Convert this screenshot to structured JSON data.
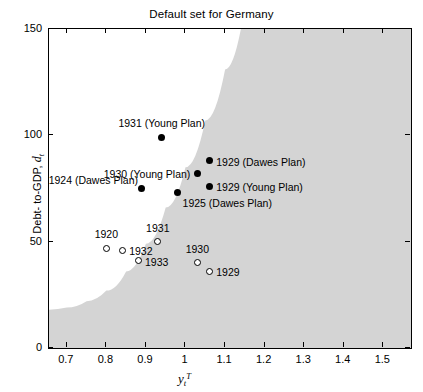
{
  "chart_data": {
    "type": "scatter",
    "title": "Default set for Germany",
    "xlabel": "y_t^T",
    "ylabel": "Debt- to-GDP, d_t",
    "xlim": [
      0.655,
      1.57
    ],
    "ylim": [
      0,
      150
    ],
    "xticks": [
      0.7,
      0.8,
      0.9,
      1.0,
      1.1,
      1.2,
      1.3,
      1.4,
      1.5
    ],
    "xticklabels": [
      "0.7",
      "0.8",
      "0.9",
      "1",
      "1.1",
      "1.2",
      "1.3",
      "1.4",
      "1.5"
    ],
    "yticks": [
      0,
      50,
      100,
      150
    ],
    "yticklabels": [
      "0",
      "50",
      "100",
      "150"
    ],
    "grid": false,
    "legend": "none",
    "shaded_region": {
      "name": "default-set",
      "color": "#d4d4d4",
      "description": "Shaded default region to the lower-right of the boundary curve",
      "boundary_points": [
        [
          0.655,
          18
        ],
        [
          0.7,
          19
        ],
        [
          0.75,
          22
        ],
        [
          0.8,
          27
        ],
        [
          0.85,
          36
        ],
        [
          0.9,
          49
        ],
        [
          0.95,
          66
        ],
        [
          1.0,
          85
        ],
        [
          1.05,
          107
        ],
        [
          1.1,
          131
        ],
        [
          1.14,
          150
        ]
      ]
    },
    "series": [
      {
        "name": "Dawes/Young Plan obligations",
        "marker": "filled-circle",
        "color": "#000000",
        "points": [
          {
            "label": "1931 (Young Plan)",
            "x": 0.94,
            "y": 99,
            "label_pos": "above"
          },
          {
            "label": "1929 (Dawes Plan)",
            "x": 1.06,
            "y": 88,
            "label_pos": "right"
          },
          {
            "label": "1930 (Young Plan)",
            "x": 1.03,
            "y": 82,
            "label_pos": "left"
          },
          {
            "label": "1929 (Young Plan)",
            "x": 1.06,
            "y": 76,
            "label_pos": "right"
          },
          {
            "label": "1924 (Dawes Plan)",
            "x": 0.89,
            "y": 75,
            "label_pos": "above-left"
          },
          {
            "label": "1925 (Dawes Plan)",
            "x": 0.98,
            "y": 73,
            "label_pos": "below-right"
          }
        ]
      },
      {
        "name": "Actual debt-to-GDP outcomes",
        "marker": "hollow-circle",
        "color": "#000000",
        "points": [
          {
            "label": "1920",
            "x": 0.8,
            "y": 47,
            "label_pos": "above"
          },
          {
            "label": "1932",
            "x": 0.84,
            "y": 46,
            "label_pos": "right"
          },
          {
            "label": "1931",
            "x": 0.93,
            "y": 50,
            "label_pos": "above"
          },
          {
            "label": "1933",
            "x": 0.88,
            "y": 41,
            "label_pos": "right"
          },
          {
            "label": "1930",
            "x": 1.03,
            "y": 40,
            "label_pos": "above"
          },
          {
            "label": "1929",
            "x": 1.06,
            "y": 36,
            "label_pos": "right"
          }
        ]
      }
    ]
  },
  "title": {
    "text": "Default set for Germany"
  },
  "axes": {
    "x_label_main": "y",
    "x_label_sub": "t",
    "x_label_sup": "T",
    "y_label_text": "Debt- to-GDP, ",
    "y_label_var": "d",
    "y_label_sub": "t"
  }
}
